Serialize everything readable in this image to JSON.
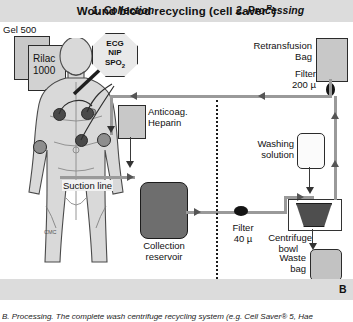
{
  "figure": {
    "title": "Wound blood recycling (cell saver",
    "title_superscript": "R",
    "title_suffix": ")",
    "panel_letter": "B",
    "caption": "B. Processing. The complete wash centrifuge recycling system (e.g. Cell Saver® 5, Hae"
  },
  "phases": {
    "left": "1. Collection",
    "right": "2. Processing"
  },
  "collection": {
    "iv_bag_back": "Gel 500",
    "iv_bag_front_line1": "Rilac",
    "iv_bag_front_line2": "1000",
    "monitor_line1": "ECG",
    "monitor_line2": "NIP",
    "monitor_line3": "SPO",
    "monitor_line3_sub": "2",
    "anticoagulant_line1": "Anticoag.",
    "anticoagulant_line2": "Heparin",
    "suction_line": "Suction line",
    "reservoir_line1": "Collection",
    "reservoir_line2": "reservoir"
  },
  "processing": {
    "retransfusion_line1": "Retransfusion",
    "retransfusion_line2": "Bag",
    "filter_200_line1": "Filter",
    "filter_200_line2": "200 µ",
    "filter_40_line1": "Filter",
    "filter_40_line2": "40 µ",
    "washing_line1": "Washing",
    "washing_line2": "solution",
    "centrifuge_line1": "Centrifuge",
    "centrifuge_line2": "bowl",
    "waste_line1": "Waste",
    "waste_line2": "bag"
  },
  "colors": {
    "band": "#dcdcdc",
    "tubing": "#9a9a9a",
    "reservoir": "#6e6e6e",
    "bowl": "#4e4e4e",
    "filter": "#141414"
  }
}
